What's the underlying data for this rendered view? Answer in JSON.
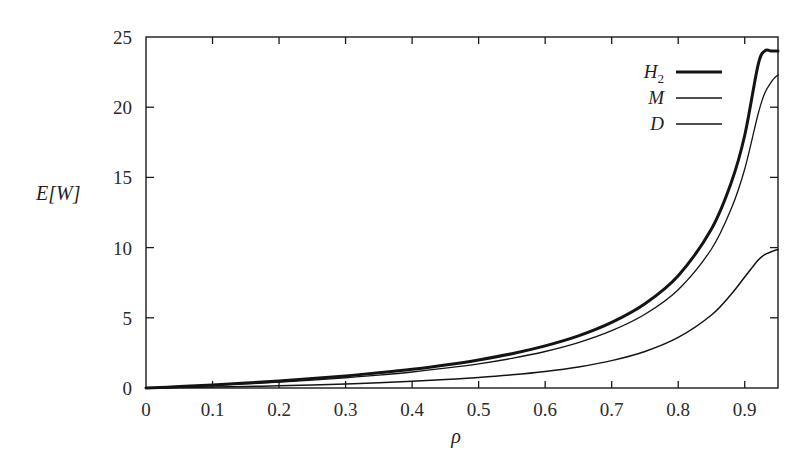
{
  "chart_data": {
    "type": "line",
    "title": "",
    "xlabel": "ρ",
    "ylabel": "E[W]",
    "xlim": [
      0,
      0.95
    ],
    "ylim": [
      0,
      25
    ],
    "grid": false,
    "legend_position": "top-right-inside",
    "x_ticks": [
      0,
      0.1,
      0.2,
      0.3,
      0.4,
      0.5,
      0.6,
      0.7,
      0.8,
      0.9
    ],
    "x_tick_labels": [
      "0",
      "0.1",
      "0.2",
      "0.3",
      "0.4",
      "0.5",
      "0.6",
      "0.7",
      "0.8",
      "0.9"
    ],
    "y_ticks": [
      0,
      5,
      10,
      15,
      20,
      25
    ],
    "y_tick_labels": [
      "0",
      "5",
      "10",
      "15",
      "20",
      "25"
    ],
    "x": [
      0.0,
      0.05,
      0.1,
      0.15,
      0.2,
      0.25,
      0.3,
      0.35,
      0.4,
      0.45,
      0.5,
      0.55,
      0.6,
      0.65,
      0.7,
      0.75,
      0.8,
      0.85,
      0.88,
      0.9,
      0.92,
      0.93,
      0.94,
      0.945,
      0.95
    ],
    "series": [
      {
        "name": "H_2",
        "label": "H",
        "sublabel": "2",
        "line_width": 3.0,
        "color": "#141414",
        "values": [
          0.0,
          0.1,
          0.22,
          0.35,
          0.5,
          0.67,
          0.86,
          1.08,
          1.33,
          1.64,
          2.0,
          2.44,
          3.0,
          3.71,
          4.67,
          6.0,
          8.0,
          11.33,
          14.67,
          18.0,
          23.0,
          24.0,
          24.0,
          24.0,
          24.0
        ]
      },
      {
        "name": "M",
        "label": "M",
        "sublabel": "",
        "line_width": 1.3,
        "color": "#141414",
        "values": [
          0.0,
          0.08,
          0.18,
          0.29,
          0.42,
          0.56,
          0.73,
          0.92,
          1.14,
          1.41,
          1.72,
          2.11,
          2.6,
          3.23,
          4.08,
          5.25,
          7.0,
          9.9,
          12.8,
          15.6,
          19.5,
          21.0,
          21.8,
          22.1,
          22.3
        ]
      },
      {
        "name": "D",
        "label": "D",
        "sublabel": "",
        "line_width": 1.5,
        "color": "#141414",
        "values": [
          0.0,
          0.03,
          0.07,
          0.11,
          0.16,
          0.22,
          0.29,
          0.38,
          0.48,
          0.6,
          0.75,
          0.94,
          1.18,
          1.5,
          1.95,
          2.6,
          3.6,
          5.2,
          6.7,
          7.9,
          9.1,
          9.5,
          9.7,
          9.8,
          9.85
        ]
      }
    ]
  },
  "legend": {
    "entries": [
      {
        "label": "H",
        "sublabel": "2"
      },
      {
        "label": "M",
        "sublabel": ""
      },
      {
        "label": "D",
        "sublabel": ""
      }
    ]
  },
  "axes": {
    "y_axis_title": "E[W]",
    "x_axis_title": "ρ"
  }
}
